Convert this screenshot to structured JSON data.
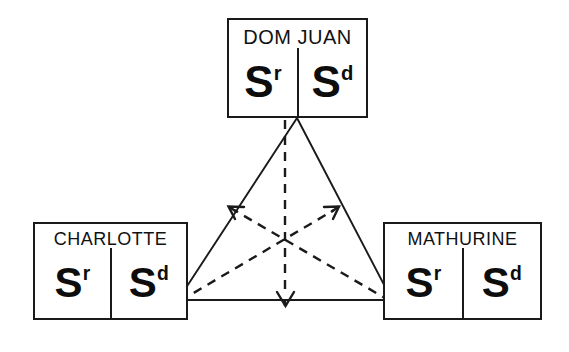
{
  "diagram": {
    "type": "actantial-triangle",
    "caption": "",
    "canvas": {
      "width": 569,
      "height": 352
    },
    "colors": {
      "stroke": "#1a1a1a",
      "text": "#111111",
      "background": "#ffffff"
    },
    "nodes": [
      {
        "id": "dom-juan",
        "label": "DOM JUAN",
        "position": "top",
        "cells": [
          {
            "base": "S",
            "superscript": "r",
            "name": "s-r-symbol"
          },
          {
            "base": "S",
            "superscript": "d",
            "name": "s-d-symbol"
          }
        ]
      },
      {
        "id": "charlotte",
        "label": "CHARLOTTE",
        "position": "bottom-left",
        "cells": [
          {
            "base": "S",
            "superscript": "r",
            "name": "s-r-symbol"
          },
          {
            "base": "S",
            "superscript": "d",
            "name": "s-d-symbol"
          }
        ]
      },
      {
        "id": "mathurine",
        "label": "MATHURINE",
        "position": "bottom-right",
        "cells": [
          {
            "base": "S",
            "superscript": "r",
            "name": "s-r-symbol"
          },
          {
            "base": "S",
            "superscript": "d",
            "name": "s-d-symbol"
          }
        ]
      }
    ],
    "edges": {
      "solid_triangle": {
        "style": "solid",
        "vertices": [
          {
            "x": 297,
            "y": 118,
            "at": "dom-juan"
          },
          {
            "x": 178,
            "y": 300,
            "at": "charlotte"
          },
          {
            "x": 392,
            "y": 300,
            "at": "mathurine"
          }
        ]
      },
      "dashed_arrows": [
        {
          "id": "arrow-dom-juan-down",
          "from": "dom-juan",
          "from_point": {
            "x": 285,
            "y": 120
          },
          "to_point": {
            "x": 285,
            "y": 306
          },
          "style": "dashed",
          "arrowhead": "end",
          "direction": "down"
        },
        {
          "id": "arrow-charlotte-up-right",
          "from": "charlotte",
          "from_point": {
            "x": 180,
            "y": 301
          },
          "to_point": {
            "x": 339,
            "y": 207
          },
          "style": "dashed",
          "arrowhead": "end",
          "direction": "up-right"
        },
        {
          "id": "arrow-mathurine-up-left",
          "from": "mathurine",
          "from_point": {
            "x": 390,
            "y": 301
          },
          "to_point": {
            "x": 228,
            "y": 207
          },
          "style": "dashed",
          "arrowhead": "end",
          "direction": "up-left"
        }
      ],
      "centroid": {
        "x": 283,
        "y": 240
      }
    }
  }
}
